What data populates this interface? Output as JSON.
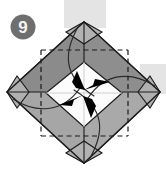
{
  "figure": {
    "kind": "origami-instruction-diagram",
    "step_badge": {
      "label": "9",
      "shape": "circle",
      "fill_color": "#6e6e6e",
      "text_color": "#f2f2f2"
    },
    "background": {
      "page_color": "#ffffff",
      "band_color": "#e3e3e3",
      "bands": [
        {
          "name": "top-vertical-band",
          "x": 64,
          "y": 0,
          "width": 42,
          "height": 26
        },
        {
          "name": "right-horizontal-band",
          "x": 140,
          "y": 64,
          "width": 26,
          "height": 30
        }
      ]
    },
    "palette": {
      "paper_dark_gray": "#8e8e8e",
      "paper_mid_gray": "#9e9e9e",
      "paper_light_gray": "#b4b4b4",
      "paper_white": "#fdfdfd",
      "paper_offwhite": "#f0f0f0",
      "outline": "#1a1a1a",
      "crease_dashed": "#1a1a1a",
      "arrow_fill": "#000000"
    },
    "geometry": {
      "outer_diamond": {
        "top": [
          84,
          22
        ],
        "right": [
          160,
          92
        ],
        "bottom": [
          84,
          163
        ],
        "left": [
          7,
          92
        ]
      },
      "corner_flaps": [
        "top",
        "right",
        "bottom",
        "left"
      ],
      "dashed_square": {
        "left": 41,
        "top": 50,
        "right": 128,
        "bottom": 136
      },
      "inner_white_diamond": {
        "top": [
          84,
          62
        ],
        "right": [
          122,
          93
        ],
        "bottom": [
          84,
          127
        ],
        "left": [
          46,
          93
        ]
      }
    },
    "annotations": {
      "arrowheads": [
        {
          "name": "arrow-from-top-left",
          "points_to": "center",
          "direction": "down-right"
        },
        {
          "name": "arrow-from-top-right",
          "points_to": "center",
          "direction": "down-left"
        },
        {
          "name": "arrow-from-bottom-left",
          "points_to": "center",
          "direction": "up-right"
        },
        {
          "name": "arrow-from-bottom-right",
          "points_to": "center",
          "direction": "up-left"
        }
      ],
      "fold_curves": [
        {
          "name": "fold-curve-top",
          "from": "top-corner",
          "to": "center"
        },
        {
          "name": "fold-curve-right",
          "from": "right-corner",
          "to": "center"
        },
        {
          "name": "fold-curve-bottom",
          "from": "bottom-corner",
          "to": "center"
        },
        {
          "name": "fold-curve-left",
          "from": "left-corner",
          "to": "center"
        }
      ]
    }
  }
}
